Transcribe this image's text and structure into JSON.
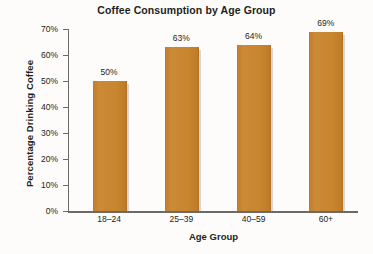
{
  "chart_data": {
    "type": "bar",
    "title": "Coffee Consumption by Age Group",
    "xlabel": "Age Group",
    "ylabel": "Percentage Drinking Coffee",
    "categories": [
      "18–24",
      "25–39",
      "40–59",
      "60+"
    ],
    "values": [
      50,
      63,
      64,
      69
    ],
    "value_labels": [
      "50%",
      "63%",
      "64%",
      "69%"
    ],
    "ylim": [
      0,
      70
    ],
    "ytick_values": [
      0,
      10,
      20,
      30,
      40,
      50,
      60,
      70
    ],
    "ytick_labels": [
      "0%",
      "10%",
      "20%",
      "30%",
      "40%",
      "50%",
      "60%",
      "70%"
    ],
    "grid": false,
    "legend": "none",
    "bar_color": "#c98733",
    "bar_shadow_color": "#d9d5d1",
    "axis_color": "#6d6a66",
    "text_color": "#231f20",
    "background_color": "#fdfcfa"
  }
}
